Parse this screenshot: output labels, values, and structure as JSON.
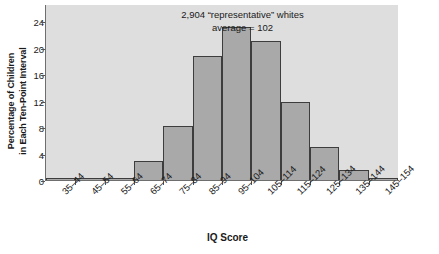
{
  "chart_data": {
    "type": "bar",
    "title": "",
    "annotation_lines": [
      "2,904 “representative” whites",
      "average = 102"
    ],
    "xlabel": "IQ Score",
    "ylabel_lines": [
      "Percentage of Children",
      "in Each Ten-Point Interval"
    ],
    "categories": [
      "35–44",
      "45–54",
      "55–64",
      "65–74",
      "75–84",
      "85–94",
      "95–104",
      "105–114",
      "115–124",
      "125–134",
      "135–144",
      "145–154"
    ],
    "values": [
      0.4,
      0.4,
      0.4,
      3.0,
      8.3,
      18.9,
      23.3,
      21.2,
      12.0,
      5.2,
      1.6,
      0.4
    ],
    "yticks": [
      0,
      4,
      8,
      12,
      16,
      20,
      24
    ],
    "ytick_labels": [
      "0",
      "4",
      "8",
      "12",
      "16",
      "20",
      "24"
    ],
    "ylim": [
      0,
      26.6
    ],
    "grid": false,
    "legend": null,
    "bar_fill_color": "#a9a9a9",
    "bar_edge_color": "#3d3d3d",
    "panel_background_color": "#dedede",
    "text_color": "#1a1a1a"
  }
}
